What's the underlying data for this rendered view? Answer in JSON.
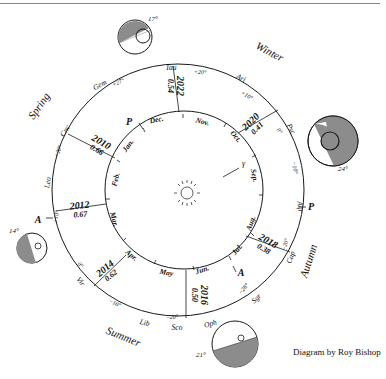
{
  "credit": "Diagram by Roy Bishop",
  "seasons": [
    {
      "label": "Winter",
      "x": 268,
      "y": 55,
      "rot": 28
    },
    {
      "label": "Spring",
      "x": 42,
      "y": 108,
      "rot": -55
    },
    {
      "label": "Summer",
      "x": 122,
      "y": 340,
      "rot": 22
    },
    {
      "label": "Autumn",
      "x": 312,
      "y": 262,
      "rot": -72
    }
  ],
  "constellations": [
    {
      "label": "Tau",
      "x": 171,
      "y": 70,
      "rot": 0
    },
    {
      "label": "Ari",
      "x": 240,
      "y": 80,
      "rot": 25
    },
    {
      "label": "Psc",
      "x": 289,
      "y": 130,
      "rot": 62
    },
    {
      "label": "Aqr",
      "x": 298,
      "y": 207,
      "rot": 85
    },
    {
      "label": "Cap",
      "x": 293,
      "y": 258,
      "rot": -70
    },
    {
      "label": "Sgr",
      "x": 258,
      "y": 300,
      "rot": -45
    },
    {
      "label": "Oph",
      "x": 211,
      "y": 326,
      "rot": -15
    },
    {
      "label": "Sco",
      "x": 177,
      "y": 330,
      "rot": 0
    },
    {
      "label": "Lib",
      "x": 144,
      "y": 325,
      "rot": 15
    },
    {
      "label": "Vir",
      "x": 79,
      "y": 283,
      "rot": 50
    },
    {
      "label": "Leo",
      "x": 50,
      "y": 183,
      "rot": -80
    },
    {
      "label": "Cnc",
      "x": 67,
      "y": 132,
      "rot": -58
    },
    {
      "label": "Gem",
      "x": 101,
      "y": 87,
      "rot": -30
    }
  ],
  "declinations": [
    {
      "label": "+20°",
      "x": 200,
      "y": 74,
      "rot": 5
    },
    {
      "label": "+27°",
      "x": 119,
      "y": 84,
      "rot": -25
    },
    {
      "label": "+10°",
      "x": 246,
      "y": 97,
      "rot": 30
    },
    {
      "label": "0°",
      "x": 278,
      "y": 132,
      "rot": 55
    },
    {
      "label": "−10°",
      "x": 293,
      "y": 168,
      "rot": 80
    },
    {
      "label": "−20°",
      "x": 287,
      "y": 245,
      "rot": -75
    },
    {
      "label": "−28°",
      "x": 245,
      "y": 290,
      "rot": -50
    },
    {
      "label": "−20°",
      "x": 172,
      "y": 319,
      "rot": 0
    },
    {
      "label": "−10°",
      "x": 114,
      "y": 305,
      "rot": 25
    },
    {
      "label": "0°",
      "x": 79,
      "y": 266,
      "rot": 50
    },
    {
      "label": "+10°",
      "x": 58,
      "y": 217,
      "rot": -80
    },
    {
      "label": "+20°",
      "x": 60,
      "y": 152,
      "rot": -70
    }
  ],
  "months": [
    {
      "label": "Dec.",
      "x": 157,
      "y": 122,
      "rot": -12
    },
    {
      "label": "Nov.",
      "x": 202,
      "y": 124,
      "rot": 15
    },
    {
      "label": "Oct.",
      "x": 234,
      "y": 138,
      "rot": 50
    },
    {
      "label": "Sep.",
      "x": 252,
      "y": 176,
      "rot": 78
    },
    {
      "label": "Aug.",
      "x": 253,
      "y": 224,
      "rot": -70
    },
    {
      "label": "Jul.",
      "x": 239,
      "y": 251,
      "rot": -50
    },
    {
      "label": "Jun.",
      "x": 203,
      "y": 272,
      "rot": -18
    },
    {
      "label": "May",
      "x": 166,
      "y": 275,
      "rot": 10
    },
    {
      "label": "Apr.",
      "x": 130,
      "y": 257,
      "rot": 40
    },
    {
      "label": "Mar.",
      "x": 112,
      "y": 220,
      "rot": 75
    },
    {
      "label": "Feb.",
      "x": 118,
      "y": 180,
      "rot": -75
    },
    {
      "label": "Jan.",
      "x": 130,
      "y": 147,
      "rot": -55
    }
  ],
  "oppositions": [
    {
      "year": "2022",
      "value": "0.54",
      "x": 175,
      "y": 86,
      "rot": 90
    },
    {
      "year": "2020",
      "value": "0.41",
      "x": 254,
      "y": 125,
      "rot": -45
    },
    {
      "year": "2010",
      "value": "0.66",
      "x": 99,
      "y": 146,
      "rot": 30
    },
    {
      "year": "2012",
      "value": "0.67",
      "x": 80,
      "y": 210,
      "rot": -5
    },
    {
      "year": "2014",
      "value": "0.62",
      "x": 108,
      "y": 272,
      "rot": -40
    },
    {
      "year": "2016",
      "value": "0.50",
      "x": 199,
      "y": 295,
      "rot": 90
    },
    {
      "year": "2018",
      "value": "0.38",
      "x": 266,
      "y": 245,
      "rot": 30
    }
  ],
  "markers": [
    {
      "label": "P",
      "x": 129,
      "y": 125
    },
    {
      "label": "A",
      "x": 38,
      "y": 223
    },
    {
      "label": "P",
      "x": 311,
      "y": 210
    },
    {
      "label": "A",
      "x": 241,
      "y": 276
    }
  ],
  "vernal_equinox_symbol": "γ",
  "tilt_views": [
    {
      "label": "17°",
      "x": 153,
      "y": 21
    },
    {
      "label": "24°",
      "x": 343,
      "y": 171
    },
    {
      "label": "14°",
      "x": 14,
      "y": 233
    },
    {
      "label": "21°",
      "x": 201,
      "y": 357
    }
  ],
  "colors": {
    "shade": "#8c8c8c",
    "line": "#1a1a1a",
    "text": "#111111"
  }
}
